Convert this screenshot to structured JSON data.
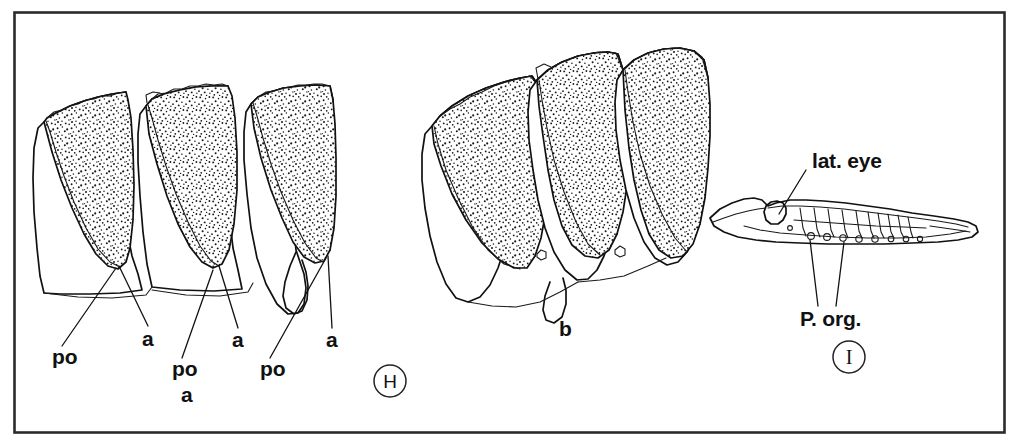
{
  "figure": {
    "background_color": "#ffffff",
    "ink_color": "#111111",
    "frame": {
      "name": "figure-border",
      "x": 14,
      "y": 12,
      "width": 991,
      "height": 421
    },
    "panels": [
      {
        "id": "H",
        "letter": "H",
        "letter_style": "circled",
        "circle": {
          "cx": 390,
          "cy": 381,
          "r": 16
        },
        "sub_label": "a",
        "sub_label_pos": {
          "x": 186,
          "y": 399
        },
        "description": "three isolated scales / plates in lateral view with stippled surface",
        "callouts": [
          {
            "label": "po",
            "x": 56,
            "y": 360,
            "tip_x": 116,
            "tip_y": 268
          },
          {
            "label": "a",
            "x": 146,
            "y": 343,
            "tip_x": 119,
            "tip_y": 266
          },
          {
            "label": "po",
            "x": 176,
            "y": 372,
            "tip_x": 213,
            "tip_y": 270
          },
          {
            "label": "a",
            "x": 236,
            "y": 344,
            "tip_x": 219,
            "tip_y": 266
          },
          {
            "label": "po",
            "x": 263,
            "y": 373,
            "tip_x": 320,
            "tip_y": 262
          },
          {
            "label": "a",
            "x": 330,
            "y": 345,
            "tip_x": 326,
            "tip_y": 256
          }
        ]
      },
      {
        "id": "b",
        "letter": "b",
        "letter_style": "plain",
        "letter_pos": {
          "x": 560,
          "y": 330
        },
        "description": "group of three overlapping stippled plates in oblique view"
      },
      {
        "id": "I",
        "letter": "I",
        "letter_style": "circled",
        "circle": {
          "cx": 849,
          "cy": 357,
          "r": 16
        },
        "description": "elongate organism in lateral view showing lateral eye and photophore series",
        "callouts": [
          {
            "label": "lat. eye",
            "x": 812,
            "y": 163,
            "tip_x": 779,
            "tip_y": 214
          },
          {
            "label": "P. org.",
            "x": 805,
            "y": 320,
            "tip_x": 809,
            "tip_y": 236
          },
          {
            "label": "P. org.",
            "x": 805,
            "y": 320,
            "tip_x": 843,
            "tip_y": 238
          }
        ],
        "photophore_count": 9
      }
    ],
    "labels": {
      "po": "po",
      "a": "a",
      "b": "b",
      "lat_eye": "lat. eye",
      "p_org": "P. org.",
      "panel_h": "H",
      "panel_i": "I"
    }
  }
}
